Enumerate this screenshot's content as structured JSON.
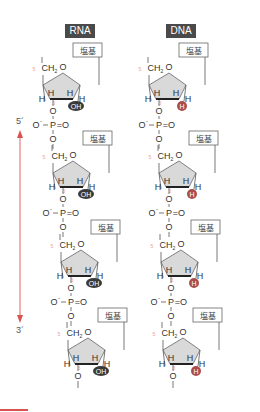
{
  "titles": {
    "rna": "RNA",
    "dna": "DNA"
  },
  "direction": {
    "top": "5´",
    "bottom": "3´",
    "arrow_color": "#d9534f"
  },
  "labels": {
    "base": "塩基",
    "ch2": "CH",
    "ch2_sub": "2",
    "ring_o": "O",
    "h": "H",
    "o": "O",
    "o_minus": "O",
    "minus": "−",
    "p": "P",
    "p_double_o": "=O",
    "carbon5": "5",
    "carbon3": "3"
  },
  "rna": {
    "pentose_2prime": "OH",
    "badge_color": "#3a3a3a"
  },
  "dna": {
    "pentose_2prime": "H",
    "badge_color": "#a94d4d"
  },
  "colors": {
    "ring_fill": "#d9d9d9",
    "ring_stroke": "#555555",
    "accent": "#d9534f",
    "carbon_label": "#e8a0a0"
  }
}
